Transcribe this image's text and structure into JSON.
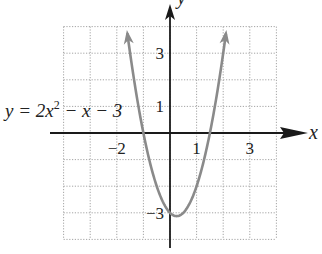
{
  "problem_number": "63.",
  "chart_data": {
    "type": "line",
    "title": "",
    "equation_label": "y = 2x² − x − 3",
    "function": {
      "a": 2,
      "b": -1,
      "c": -3
    },
    "xlabel": "x",
    "ylabel": "y",
    "xlim": [
      -4,
      4
    ],
    "ylim": [
      -4,
      4
    ],
    "grid": true,
    "grid_style": "dotted",
    "x_tick_labels": [
      {
        "value": -2,
        "label": "−2"
      },
      {
        "value": 1,
        "label": "1"
      },
      {
        "value": 3,
        "label": "3"
      }
    ],
    "y_tick_labels": [
      {
        "value": 3,
        "label": "3"
      },
      {
        "value": 1,
        "label": "1"
      },
      {
        "value": -3,
        "label": "−3"
      }
    ],
    "vertex": {
      "x": 0.25,
      "y": -3.125
    },
    "x_intercepts": [
      -1,
      1.5
    ],
    "y_intercept": -3,
    "series": [
      {
        "name": "y = 2x^2 - x - 3",
        "x": [
          -1.6,
          -1.5,
          -1.25,
          -1,
          -0.75,
          -0.5,
          -0.25,
          0,
          0.25,
          0.5,
          0.75,
          1,
          1.25,
          1.5,
          1.75,
          2.0,
          2.1
        ],
        "values": [
          3.72,
          3.0,
          1.375,
          0,
          -1.125,
          -2.0,
          -2.625,
          -3,
          -3.125,
          -3.0,
          -2.625,
          -2,
          -1.125,
          0,
          1.375,
          3.0,
          3.72
        ],
        "color": "#8a8a8a"
      }
    ],
    "colors": {
      "curve": "#8a8a8a",
      "axes": "#1a1a1a",
      "grid": "#9a9a9a"
    }
  }
}
